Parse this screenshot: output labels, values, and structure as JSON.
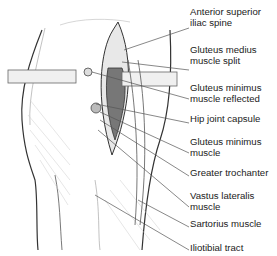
{
  "figure": {
    "labels": [
      {
        "line1": "Anterior superior",
        "line2": "iliac spine",
        "top": 7
      },
      {
        "line1": "Gluteus medius",
        "line2": "muscle split",
        "top": 45
      },
      {
        "line1": "Gluteus minimus",
        "line2": "muscle reflected",
        "top": 83
      },
      {
        "line1": "Hip joint capsule",
        "line2": "",
        "top": 114
      },
      {
        "line1": "Gluteus minimus",
        "line2": "muscle",
        "top": 137
      },
      {
        "line1": "Greater trochanter",
        "line2": "",
        "top": 168
      },
      {
        "line1": "Vastus lateralis",
        "line2": "muscle",
        "top": 191
      },
      {
        "line1": "Sartorius muscle",
        "line2": "",
        "top": 219
      },
      {
        "line1": "Iliotibial tract",
        "line2": "",
        "top": 243
      }
    ]
  }
}
